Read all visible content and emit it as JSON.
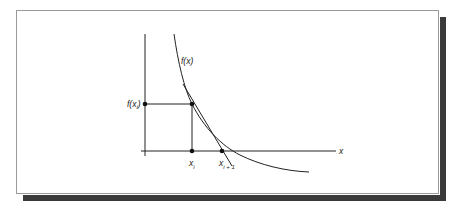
{
  "figure": {
    "labels": {
      "curve": "f(x)",
      "fxi": "f(x",
      "fxi_sub": "i",
      "fxi_close": ")",
      "x_axis": "x",
      "xi": "x",
      "xi_sub": "i",
      "xi1": "x",
      "xi1_sub": "i + 1"
    },
    "colors": {
      "line": "#222222",
      "frame_border": "#9a9a9a",
      "shadow": "#3a3a3a"
    }
  }
}
